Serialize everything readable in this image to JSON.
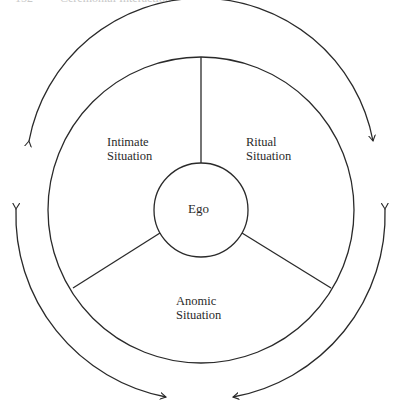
{
  "header": {
    "page_number": "152",
    "running_title": "Ceremonial Interaction"
  },
  "diagram": {
    "center_label": "Ego",
    "segments": [
      {
        "line1": "Intimate",
        "line2": "Situation"
      },
      {
        "line1": "Ritual",
        "line2": "Situation"
      },
      {
        "line1": "Anomic",
        "line2": "Situation"
      }
    ],
    "arrows": [
      "top-arc-bidirectional",
      "left-arc-bidirectional",
      "right-arc-bidirectional"
    ],
    "stroke_color": "#2a2a2a"
  }
}
